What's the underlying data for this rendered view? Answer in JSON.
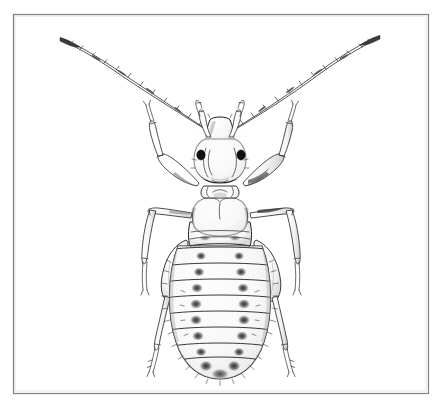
{
  "figure": {
    "title": "Dorsal-view line drawing of a wingless louse-like insect",
    "domain_note": "scientific entomological illustration, black ink on white",
    "background_color": "#ffffff",
    "ink_color": "#1d1d1d",
    "frame": {
      "name": "rectangular-border",
      "x": 13,
      "y": 14,
      "width": 415,
      "height": 379,
      "stroke_color": "#808080",
      "stroke_width": 1.2
    },
    "canvas": {
      "width": 441,
      "height": 400
    },
    "specimen": {
      "common_name": "louse",
      "view": "dorsal",
      "orientation": "head up, abdomen down",
      "body_axis_x": 220,
      "head": {
        "name": "head-capsule",
        "center_x": 220,
        "top_y": 118,
        "bottom_y": 185,
        "width": 46,
        "clypeus_label": "clypeus",
        "eyes": [
          {
            "side": "left",
            "cx": 201,
            "cy": 155,
            "rx": 4.2,
            "ry": 5.0,
            "color": "#111111"
          },
          {
            "side": "right",
            "cx": 241,
            "cy": 155,
            "rx": 4.2,
            "ry": 5.0,
            "color": "#111111"
          }
        ],
        "palps": 2
      },
      "antennae": {
        "count": 2,
        "segment_count": 12,
        "left_tip": {
          "x": 60,
          "y": 38
        },
        "right_tip": {
          "x": 378,
          "y": 36
        },
        "base_left": {
          "x": 206,
          "y": 128
        },
        "base_right": {
          "x": 236,
          "y": 127
        }
      },
      "thorax": {
        "name": "thorax",
        "pronotum_shape": "heart",
        "top_y": 196,
        "bottom_y": 240,
        "width": 52
      },
      "abdomen": {
        "name": "abdomen",
        "top_y": 238,
        "bottom_y": 378,
        "max_width": 84,
        "segment_count": 8,
        "segment_boundaries_y": [
          248,
          264,
          280,
          296,
          312,
          328,
          344,
          360
        ],
        "paired_spot_count_per_segment": 2,
        "spot_color": "#3a3a3a",
        "setae": "fine marginal hairs along lateral and terminal margins"
      },
      "legs": {
        "count": 6,
        "pairs": [
          {
            "name": "foreleg-pair",
            "attach_y": 186,
            "direction": "forward-outward"
          },
          {
            "name": "midleg-pair",
            "attach_y": 214,
            "direction": "outward"
          },
          {
            "name": "hindleg-pair",
            "attach_y": 244,
            "direction": "backward-outward"
          }
        ],
        "segments": [
          "coxa",
          "femur",
          "tibia",
          "tarsus"
        ]
      }
    }
  }
}
